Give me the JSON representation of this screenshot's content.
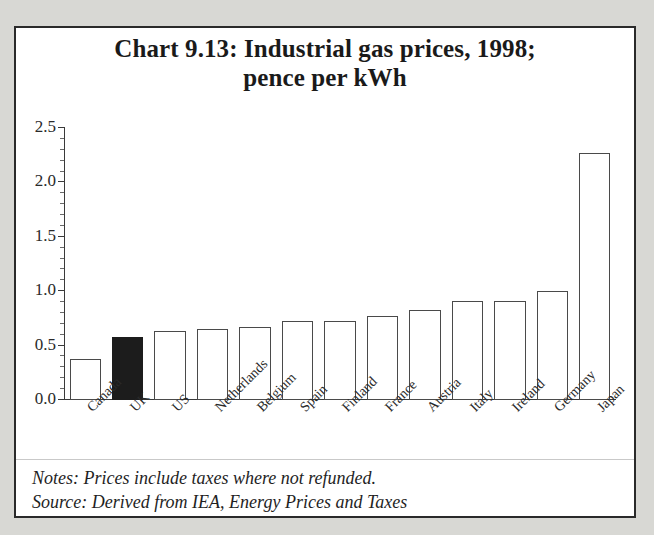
{
  "chart_data": {
    "type": "bar",
    "title": "Chart 9.13: Industrial gas prices, 1998; pence per kWh",
    "title_line1": "Chart 9.13: Industrial gas prices, 1998;",
    "title_line2": "pence per kWh",
    "xlabel": "",
    "ylabel": "",
    "ylim": [
      0.0,
      2.5
    ],
    "ytick_labels": [
      "0.0",
      "0.5",
      "1.0",
      "1.5",
      "2.0",
      "2.5"
    ],
    "ytick_values": [
      0.0,
      0.5,
      1.0,
      1.5,
      2.0,
      2.5
    ],
    "yminor_interval": 0.1,
    "grid": false,
    "legend": "none",
    "categories": [
      "Canada",
      "UK",
      "US",
      "Netherlands",
      "Belgium",
      "Spain",
      "Finland",
      "France",
      "Austria",
      "Italy",
      "Ireland",
      "Germany",
      "Japan"
    ],
    "values": [
      0.38,
      0.58,
      0.63,
      0.65,
      0.67,
      0.73,
      0.73,
      0.77,
      0.83,
      0.91,
      0.91,
      1.0,
      2.27
    ],
    "highlight_index": 1,
    "highlight_category": "UK",
    "bar_fill_color": "#ffffff",
    "bar_edge_color": "#4a4a4a",
    "highlight_fill_color": "#1c1c1c",
    "units": "pence per kWh",
    "year": 1998
  },
  "notes": {
    "line1": "Notes: Prices include taxes where not refunded.",
    "line2": "Source: Derived from IEA, Energy Prices and Taxes"
  },
  "colors": {
    "page_background": "#d8d8d4",
    "panel_background": "#ffffff",
    "panel_border": "#2a2a2a",
    "text": "#1a1a1a",
    "axis": "#3a3a3a"
  }
}
